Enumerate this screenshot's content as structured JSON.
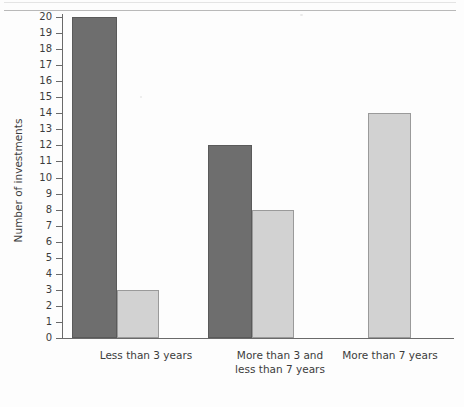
{
  "chart_data": {
    "type": "bar",
    "title": "",
    "xlabel": "",
    "ylabel": "Number of investments",
    "ylim": [
      0,
      20
    ],
    "ytick_step": 1,
    "grid": false,
    "legend": null,
    "categories": [
      "Less than 3 years",
      "More than 3 and\nless than 7 years",
      "More than 7 years"
    ],
    "yticks": [
      "20",
      "19",
      "18",
      "17",
      "16",
      "15",
      "14",
      "13",
      "12",
      "11",
      "10",
      "9",
      "8",
      "7",
      "6",
      "5",
      "4",
      "3",
      "2",
      "1",
      "0"
    ],
    "series": [
      {
        "name": "dark",
        "color": "#6e6e6e",
        "values": [
          20,
          12,
          null
        ]
      },
      {
        "name": "light",
        "color": "#d2d2d2",
        "values": [
          3,
          8,
          14
        ]
      }
    ]
  },
  "colors": {
    "dark_bar": "#6e6e6e",
    "light_bar": "#d2d2d2",
    "axis": "#6a6a6a",
    "text": "#3c3c3c",
    "background": "#fdfdfd"
  }
}
